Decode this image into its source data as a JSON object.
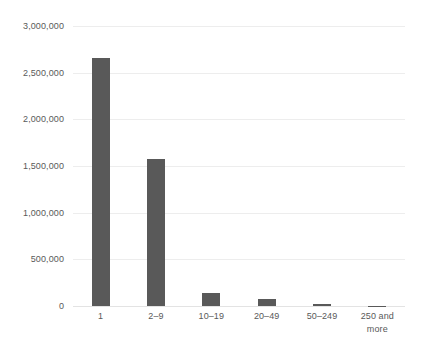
{
  "chart_data": {
    "type": "bar",
    "title": "",
    "subtitle": "",
    "xlabel": "",
    "ylabel": "",
    "categories": [
      "1",
      "2–9",
      "10–19",
      "20–49",
      "50–249",
      "250 and more"
    ],
    "values": [
      2660000,
      1580000,
      135000,
      70000,
      25000,
      3000
    ],
    "series": [
      {
        "name": "Number of enterprises",
        "values": [
          2660000,
          1580000,
          135000,
          70000,
          25000,
          3000
        ]
      }
    ],
    "ylim": [
      0,
      3000000
    ],
    "y_ticks": [
      0,
      500000,
      1000000,
      1500000,
      2000000,
      2500000,
      3000000
    ],
    "y_tick_labels": [
      "0",
      "500,000",
      "1,000,000",
      "1,500,000",
      "2,000,000",
      "2,500,000",
      "3,000,000"
    ],
    "grid": true,
    "grid_axis": "y",
    "legend": false,
    "legend_position": "none",
    "annotations": [],
    "colors": {
      "bar": "#595959",
      "gridline": "#ededed",
      "axis": "#e3e3e3",
      "label_text": "#595959",
      "background": "#ffffff"
    }
  }
}
